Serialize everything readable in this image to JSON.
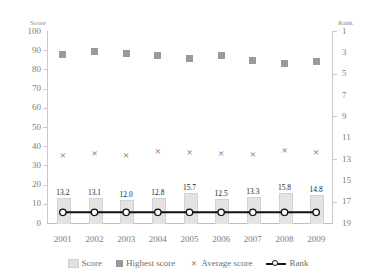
{
  "chart_data": {
    "type": "bar",
    "title": "",
    "categories": [
      "2001",
      "2002",
      "2003",
      "2004",
      "2005",
      "2006",
      "2007",
      "2008",
      "2009"
    ],
    "xlabel": "",
    "ylabel": "Score",
    "ylim": [
      0,
      100
    ],
    "y2label": "Rank",
    "y2lim": [
      19,
      1
    ],
    "y2_inverted": true,
    "grid": false,
    "legend_position": "bottom",
    "left_ticks": [
      "100",
      "90",
      "80",
      "70",
      "60",
      "50",
      "40",
      "30",
      "20",
      "10",
      "0"
    ],
    "left_tick_values": [
      100,
      90,
      80,
      70,
      60,
      50,
      40,
      30,
      20,
      10,
      0
    ],
    "right_ticks": [
      "1",
      "3",
      "5",
      "7",
      "9",
      "11",
      "13",
      "15",
      "17",
      "19"
    ],
    "right_tick_values": [
      1,
      3,
      5,
      7,
      9,
      11,
      13,
      15,
      17,
      19
    ],
    "series": [
      {
        "name": "Score",
        "type": "bar",
        "axis": "left",
        "values": [
          13.2,
          13.1,
          12.0,
          12.8,
          15.7,
          12.5,
          13.3,
          15.8,
          14.8
        ],
        "labels": [
          "13.2",
          "13.1",
          "12.0",
          "12.8",
          "15.7",
          "12.5",
          "13.3",
          "15.8",
          "14.8"
        ]
      },
      {
        "name": "Highest score",
        "type": "scatter",
        "axis": "left",
        "values": [
          88.0,
          89.5,
          88.5,
          87.0,
          85.5,
          87.0,
          84.5,
          83.0,
          84.0
        ]
      },
      {
        "name": "Average score",
        "type": "scatter",
        "axis": "left",
        "values": [
          35.0,
          36.0,
          35.0,
          37.0,
          36.5,
          36.0,
          35.5,
          37.5,
          36.5
        ]
      },
      {
        "name": "Rank",
        "type": "line",
        "axis": "right",
        "values": [
          18,
          18,
          18,
          18,
          18,
          18,
          18,
          18,
          18
        ]
      }
    ]
  },
  "legend": {
    "items": [
      {
        "label": "Score",
        "marker": "bar-swatch"
      },
      {
        "label": "Highest score",
        "marker": "square-marker"
      },
      {
        "label": "Average score",
        "marker": "x-marker"
      },
      {
        "label": "Rank",
        "marker": "line-circle-marker"
      }
    ]
  },
  "axes": {
    "left_title": "Score",
    "right_title": "Rank"
  }
}
